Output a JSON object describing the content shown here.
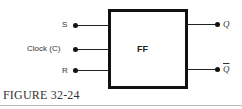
{
  "diagram": {
    "block": {
      "label": "FF"
    },
    "inputs": [
      {
        "label": "S"
      },
      {
        "label": "Clock (C)"
      },
      {
        "label": "R"
      }
    ],
    "outputs": [
      {
        "label": "Q"
      },
      {
        "label": "Q"
      }
    ],
    "caption": "FIGURE 32-24"
  }
}
